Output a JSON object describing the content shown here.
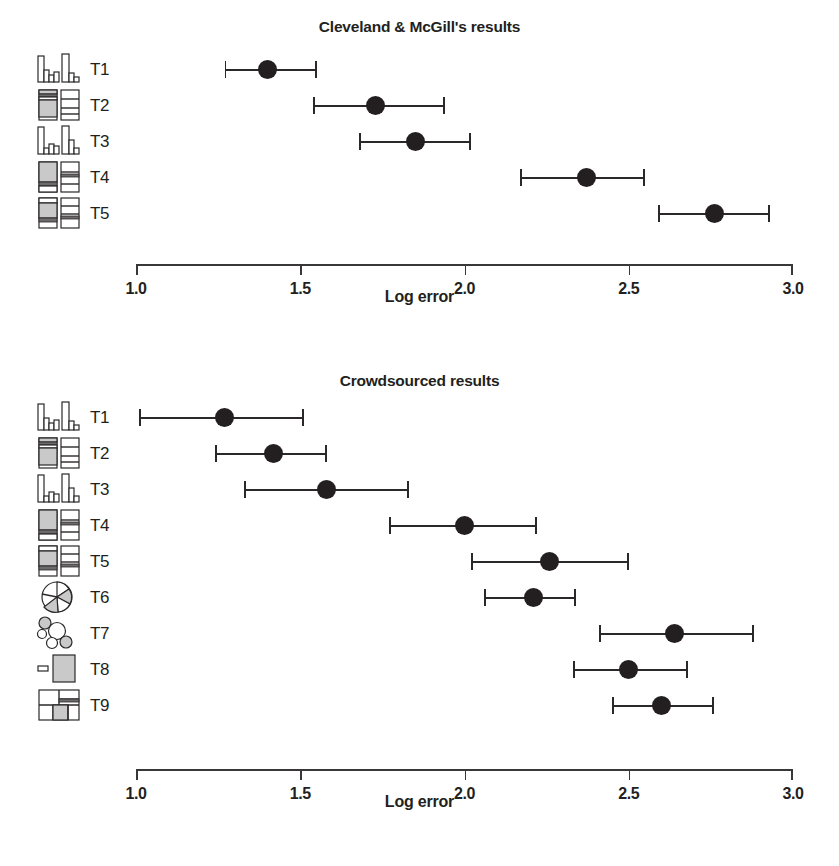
{
  "figure": {
    "axis_label": "Log error",
    "axis_ticks": [
      "1.0",
      "1.5",
      "2.0",
      "2.5",
      "3.0"
    ],
    "accent_color": "#231f20",
    "line_color": "#2b2829",
    "fill_gray": "#c9c9c9"
  },
  "chart_data": [
    {
      "type": "scatter",
      "title": "Cleveland & McGill's results",
      "xlabel": "Log error",
      "ylabel": "",
      "xlim": [
        1.0,
        3.0
      ],
      "xticks": [
        1.0,
        1.5,
        2.0,
        2.5,
        3.0
      ],
      "grid": false,
      "legend": "none",
      "orientation": "horizontal-dotplot-with-error-bars",
      "categories": [
        "T1",
        "T2",
        "T3",
        "T4",
        "T5"
      ],
      "icons": [
        "bar-chart-pair",
        "stacked-bar-pair",
        "bar-chart-pair-offset",
        "stacked-bar-large-segment",
        "stacked-bar-pair-even"
      ],
      "series": [
        {
          "name": "Log error",
          "points": [
            {
              "category": "T1",
              "value": 1.4,
              "ci_low": 1.27,
              "ci_high": 1.55
            },
            {
              "category": "T2",
              "value": 1.73,
              "ci_low": 1.54,
              "ci_high": 1.94
            },
            {
              "category": "T3",
              "value": 1.85,
              "ci_low": 1.68,
              "ci_high": 2.02
            },
            {
              "category": "T4",
              "value": 2.37,
              "ci_low": 2.17,
              "ci_high": 2.55
            },
            {
              "category": "T5",
              "value": 2.76,
              "ci_low": 2.59,
              "ci_high": 2.93
            }
          ]
        }
      ]
    },
    {
      "type": "scatter",
      "title": "Crowdsourced results",
      "xlabel": "Log error",
      "ylabel": "",
      "xlim": [
        1.0,
        3.0
      ],
      "xticks": [
        1.0,
        1.5,
        2.0,
        2.5,
        3.0
      ],
      "grid": false,
      "legend": "none",
      "orientation": "horizontal-dotplot-with-error-bars",
      "categories": [
        "T1",
        "T2",
        "T3",
        "T4",
        "T5",
        "T6",
        "T7",
        "T8",
        "T9"
      ],
      "icons": [
        "bar-chart-pair",
        "stacked-bar-pair",
        "bar-chart-pair-offset",
        "stacked-bar-large-segment",
        "stacked-bar-pair-even",
        "pie-chart",
        "bubble-chart",
        "rect-area-pair",
        "treemap"
      ],
      "series": [
        {
          "name": "Log error",
          "points": [
            {
              "category": "T1",
              "value": 1.27,
              "ci_low": 1.01,
              "ci_high": 1.51
            },
            {
              "category": "T2",
              "value": 1.42,
              "ci_low": 1.24,
              "ci_high": 1.58
            },
            {
              "category": "T3",
              "value": 1.58,
              "ci_low": 1.33,
              "ci_high": 1.83
            },
            {
              "category": "T4",
              "value": 2.0,
              "ci_low": 1.77,
              "ci_high": 2.22
            },
            {
              "category": "T5",
              "value": 2.26,
              "ci_low": 2.02,
              "ci_high": 2.5
            },
            {
              "category": "T6",
              "value": 2.21,
              "ci_low": 2.06,
              "ci_high": 2.34
            },
            {
              "category": "T7",
              "value": 2.64,
              "ci_low": 2.41,
              "ci_high": 2.88
            },
            {
              "category": "T8",
              "value": 2.5,
              "ci_low": 2.33,
              "ci_high": 2.68
            },
            {
              "category": "T9",
              "value": 2.6,
              "ci_low": 2.45,
              "ci_high": 2.76
            }
          ]
        }
      ]
    }
  ]
}
